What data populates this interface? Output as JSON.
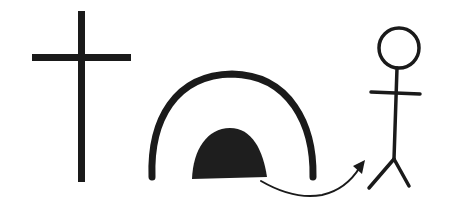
{
  "diagram": {
    "colors": {
      "ink": "#1a1a1a",
      "background": "#ffffff"
    },
    "elements": [
      {
        "id": "cross",
        "label": "Cross"
      },
      {
        "id": "tomb",
        "label": "Tomb arch"
      },
      {
        "id": "stone",
        "label": "Stone / tomb opening"
      },
      {
        "id": "arrow",
        "label": "Curved arrow"
      },
      {
        "id": "figure",
        "label": "Stick figure"
      }
    ]
  }
}
